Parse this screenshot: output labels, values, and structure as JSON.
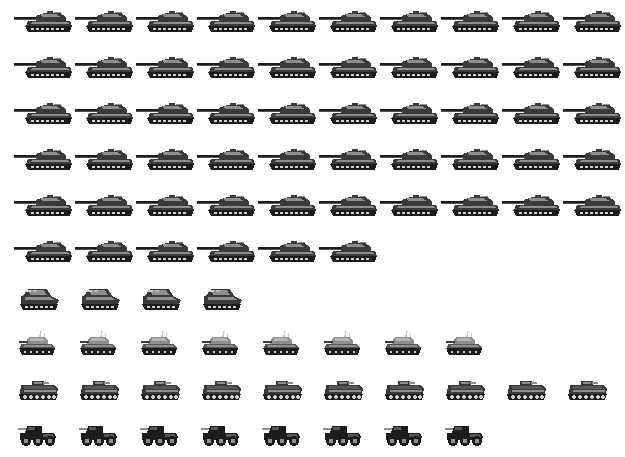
{
  "document": {
    "title": "Armored Vehicle Inventory Pictogram",
    "clipped_header_text": "",
    "background_color": "#ffffff"
  },
  "palette": {
    "dark": "#1c1c1c",
    "mid_dark": "#3a3a3a",
    "mid": "#565656",
    "light": "#8e8e8e",
    "highlight": "#b4b4b4",
    "pale": "#cfcfcf",
    "antenna": "#c8c8c8"
  },
  "chart_data": {
    "type": "pictogram",
    "title": "",
    "xlabel": "",
    "ylabel": "",
    "unit_value": 1,
    "icons_per_full_row": 10,
    "categories": [
      "Main battle tank",
      "Self-propelled gun",
      "Light tank",
      "Tracked APC / IFV",
      "Wheeled armored car"
    ],
    "values": [
      56,
      4,
      8,
      10,
      8
    ],
    "series": [
      {
        "name": "Armored vehicles",
        "values": [
          56,
          4,
          8,
          10,
          8
        ]
      }
    ],
    "rows": [
      {
        "icon": "main-battle-tank-icon",
        "count": 10,
        "group": "Main battle tank"
      },
      {
        "icon": "main-battle-tank-icon",
        "count": 10,
        "group": "Main battle tank"
      },
      {
        "icon": "main-battle-tank-icon",
        "count": 10,
        "group": "Main battle tank"
      },
      {
        "icon": "main-battle-tank-icon",
        "count": 10,
        "group": "Main battle tank"
      },
      {
        "icon": "main-battle-tank-icon",
        "count": 10,
        "group": "Main battle tank"
      },
      {
        "icon": "main-battle-tank-icon",
        "count": 6,
        "group": "Main battle tank"
      },
      {
        "icon": "self-propelled-gun-icon",
        "count": 4,
        "group": "Self-propelled gun"
      },
      {
        "icon": "light-tank-icon",
        "count": 8,
        "group": "Light tank"
      },
      {
        "icon": "tracked-apc-icon",
        "count": 10,
        "group": "Tracked APC / IFV"
      },
      {
        "icon": "wheeled-armored-car-icon",
        "count": 8,
        "group": "Wheeled armored car"
      }
    ],
    "grid": false,
    "legend": null
  },
  "groups": [
    {
      "id": "main-battle-tanks",
      "label": "Main battle tank",
      "icon": "main-battle-tank-icon",
      "total": 56,
      "rows": [
        10,
        10,
        10,
        10,
        10,
        6
      ],
      "top": 8,
      "row_height": 46,
      "icon_width": 62,
      "step": 61,
      "left": 14
    },
    {
      "id": "self-propelled-guns",
      "label": "Self-propelled gun",
      "icon": "self-propelled-gun-icon",
      "total": 4,
      "rows": [
        4
      ],
      "top": 285,
      "row_height": 46,
      "icon_width": 46,
      "step": 61,
      "left": 17
    },
    {
      "id": "light-tanks",
      "label": "Light tank",
      "icon": "light-tank-icon",
      "total": 8,
      "rows": [
        8
      ],
      "top": 330,
      "row_height": 44,
      "icon_width": 48,
      "step": 61,
      "left": 14
    },
    {
      "id": "tracked-apcs",
      "label": "Tracked APC / IFV",
      "icon": "tracked-apc-icon",
      "total": 10,
      "rows": [
        10
      ],
      "top": 378,
      "row_height": 40,
      "icon_width": 46,
      "step": 61,
      "left": 16
    },
    {
      "id": "wheeled-armored-cars",
      "label": "Wheeled armored car",
      "icon": "wheeled-armored-car-icon",
      "total": 8,
      "rows": [
        8
      ],
      "top": 422,
      "row_height": 32,
      "icon_width": 44,
      "step": 61,
      "left": 16
    }
  ]
}
